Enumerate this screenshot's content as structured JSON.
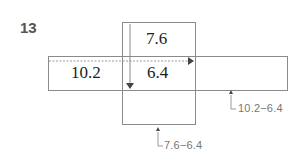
{
  "problem": {
    "number": "13"
  },
  "diagram": {
    "top_cell": "7.6",
    "left_cell": "10.2",
    "center_cell": "6.4",
    "annotation_right": "10.2−6.4",
    "annotation_bottom": "7.6−6.4"
  },
  "colors": {
    "line": "#8a8a8a",
    "text": "#222222",
    "annotation": "#777777"
  }
}
